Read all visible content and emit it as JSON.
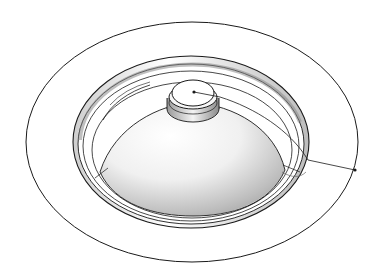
{
  "figure": {
    "subject": "Sink drain strainer flange with domed cover and center knob",
    "view": "isometric shaded CAD render",
    "colors": {
      "background": "#ffffff",
      "edge": "#1a1a1a",
      "flange_fill": "#ffffff",
      "well_shadow": "#9a9a9a",
      "dome_light": "#ffffff",
      "dome_dark": "#a8a8a8"
    },
    "parts": {
      "flange": "outer-flange",
      "well": "drain-well",
      "dome": "dome-cover",
      "knob": "center-knob",
      "sketch_line": "reference-line"
    }
  }
}
